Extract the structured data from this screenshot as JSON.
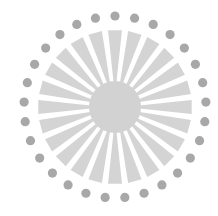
{
  "graphic": {
    "name": "sunburst-emblem",
    "center": [
      115,
      107
    ],
    "ray_color": "#d4d4d4",
    "hub_color": "#d2d2d2",
    "dot_color": "#a8a8a8",
    "ray_count": 24,
    "ray_inner_radius": 22,
    "ray_outer_radius": 77,
    "ray_inner_halfwidth_deg": 3.0,
    "ray_outer_halfwidth_deg": 5.2,
    "hub_radius": 26,
    "dot_count": 29,
    "dot_ring_radius": 91,
    "dot_radius": 4.6
  }
}
